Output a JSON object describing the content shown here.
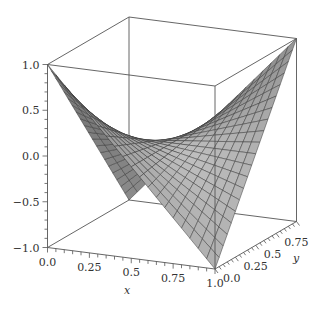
{
  "chart_data": {
    "type": "surface3d",
    "title": "",
    "function": "z = (1 - 2x)(1 - 2y)",
    "xlabel": "x",
    "ylabel": "y",
    "zlabel": "",
    "xlim": [
      0,
      1
    ],
    "ylim": [
      0,
      1
    ],
    "zlim": [
      -1,
      1
    ],
    "grid_divisions": 20,
    "x_ticks": [
      "0.0",
      "0.25",
      "0.5",
      "0.75",
      "1.0"
    ],
    "x_tick_values": [
      0,
      0.25,
      0.5,
      0.75,
      1.0
    ],
    "y_ticks": [
      "0.0",
      "0.25",
      "0.5",
      "0.75"
    ],
    "y_tick_values": [
      0,
      0.25,
      0.5,
      0.75
    ],
    "z_ticks": [
      "1.0",
      "0.5",
      "0.0",
      "-0.5",
      "-1.0"
    ],
    "z_tick_values": [
      1.0,
      0.5,
      0.0,
      -0.5,
      -1.0
    ],
    "corners": [
      {
        "x": 0,
        "y": 0,
        "z": 1
      },
      {
        "x": 1,
        "y": 1,
        "z": 1
      },
      {
        "x": 1,
        "y": 0,
        "z": -1
      },
      {
        "x": 0,
        "y": 1,
        "z": -1
      }
    ],
    "colors": {
      "surface": "#a6a6a6",
      "mesh": "#3a3a3a",
      "box": "#555555"
    }
  },
  "projection": {
    "origin": [
      47.5,
      156
    ],
    "ex": [
      167.5,
      21.5
    ],
    "ey": [
      81.5,
      -47.5
    ],
    "ez": [
      0,
      -91.5
    ]
  }
}
